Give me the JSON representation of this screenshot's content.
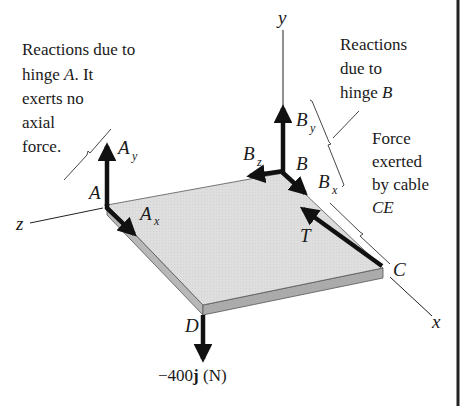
{
  "figure": {
    "type": "free-body diagram",
    "colors": {
      "plate_top": "#dcdcdc",
      "plate_edge": "#b0b0b0",
      "ink": "#111111",
      "border": "#222222"
    },
    "axes": {
      "x": "x",
      "y": "y",
      "z": "z"
    },
    "points": {
      "A": "A",
      "B": "B",
      "C": "C",
      "D": "D"
    },
    "forces": {
      "Ay": {
        "main": "A",
        "sub": "y"
      },
      "Ax": {
        "main": "A",
        "sub": "x"
      },
      "By": {
        "main": "B",
        "sub": "y"
      },
      "Bz": {
        "main": "B",
        "sub": "z"
      },
      "Bx": {
        "main": "B",
        "sub": "x"
      },
      "T": {
        "main": "T"
      },
      "load": {
        "prefix": "−400",
        "bold_unit": "j",
        "suffix": " (N)"
      }
    },
    "annotations": {
      "hinge_a": [
        "Reactions due to",
        "hinge ",
        "A",
        ".  It",
        "exerts no",
        "axial",
        "force."
      ],
      "hinge_b": [
        "Reactions",
        "due to",
        "hinge ",
        "B"
      ],
      "cable": [
        "Force",
        "exerted",
        "by cable",
        "CE"
      ]
    }
  }
}
